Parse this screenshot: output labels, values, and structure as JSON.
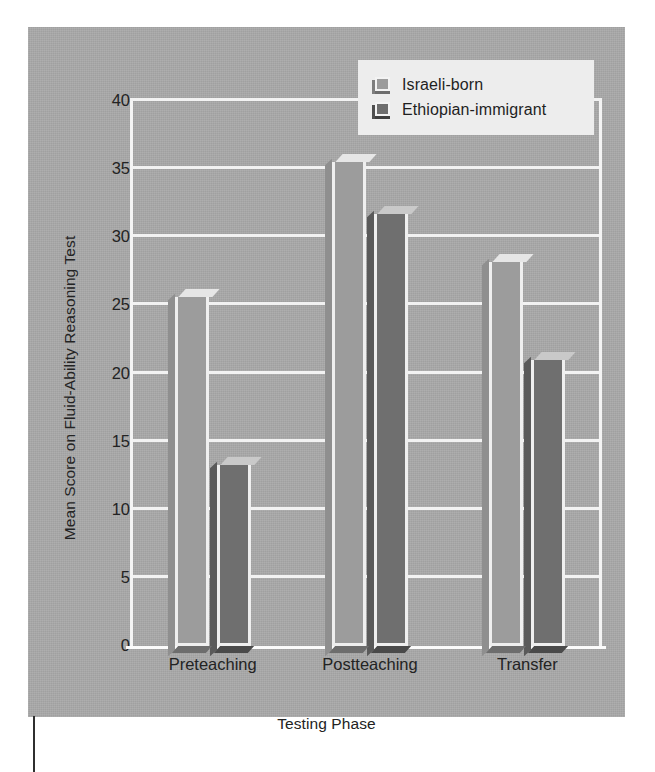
{
  "figure": {
    "background_color": "#a9a9a9",
    "plot_background_color": "#a9a9a9",
    "gridline_color": "#f2f2f2",
    "legend_background_color": "#ededed"
  },
  "chart_data": {
    "type": "bar",
    "title": "",
    "xlabel": "Testing Phase",
    "ylabel": "Mean Score on Fluid-Ability Reasoning Test",
    "categories": [
      "Preteaching",
      "Postteaching",
      "Transfer"
    ],
    "series": [
      {
        "name": "Israeli-born",
        "color": "#9c9c9c",
        "values": [
          25.6,
          35.5,
          28.2
        ]
      },
      {
        "name": "Ethiopian-immigrant",
        "color": "#6f6f6f",
        "values": [
          13.3,
          31.7,
          21.0
        ]
      }
    ],
    "ylim": [
      0,
      40
    ],
    "yticks": [
      "0",
      "5",
      "10",
      "15",
      "20",
      "25",
      "30",
      "35",
      "40"
    ],
    "ytick_values": [
      0,
      5,
      10,
      15,
      20,
      25,
      30,
      35,
      40
    ],
    "grid": true,
    "grid_axis": "y",
    "legend_position": "top-right",
    "bar_style": "3d-extruded"
  },
  "legend": {
    "items": [
      {
        "label": "Israeli-born",
        "swatch": "light-gray-3d-swatch"
      },
      {
        "label": "Ethiopian-immigrant",
        "swatch": "dark-gray-3d-swatch"
      }
    ]
  }
}
